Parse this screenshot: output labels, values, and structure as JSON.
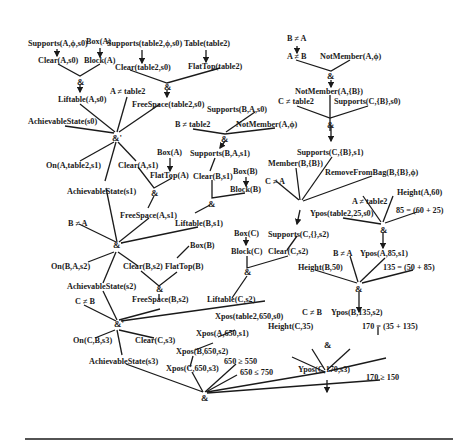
{
  "nodes": {
    "box_a": "Box(A)",
    "supports_a_phi_s0": "Supports(A,ϕ,s0)",
    "supports_table2_phi_s0": "Supports(table2,ϕ,s0)",
    "table_table2": "Table(table2)",
    "clear_a_s0": "Clear(A,s0)",
    "block_a": "Block(A)",
    "clear_table2_s0": "Clear(table2,s0)",
    "flattop_table2": "FlatTop(table2)",
    "liftable_a_s0": "Liftable(A,s0)",
    "a_neq_table2": "A ≠ table2",
    "freespace_table2_s0": "FreeSpace(table2,s0)",
    "achievable_s0": "AchievableState(s0)",
    "b_neq_a_top": "B ≠ A",
    "a_neq_b": "A ≠ B",
    "notmember_a_phi_top": "NotMember(A,ϕ)",
    "notmember_a_b": "NotMember(A,{B})",
    "c_neq_table2": "C ≠ table2",
    "supports_c_b_s0": "Supports(C,{B},s0)",
    "supports_b_a_s0": "Supports(B,A,s0)",
    "b_neq_table2": "B ≠ table2",
    "notmember_a_phi": "NotMember(A,ϕ)",
    "supports_c_b_s1": "Supports(C,{B},s1)",
    "member_b_b": "Member(B,{B})",
    "removefrombag": "RemoveFromBag(B,{B},ϕ)",
    "c_neq_a": "C ≠ A",
    "on_a_table2_s1": "On(A,table2,s1)",
    "clear_a_s1": "Clear(A,s1)",
    "box_a2": "Box(A)",
    "flattop_a": "FlatTop(A)",
    "achievable_s1": "AchievableState(s1)",
    "supports_b_a_s1": "Supports(B,A,s1)",
    "clear_b_s1": "Clear(B,s1)",
    "box_b": "Box(B)",
    "block_b": "Block(B)",
    "freespace_a_s1": "FreeSpace(A,s1)",
    "liftable_b_s1": "Liftable(B,s1)",
    "b_neq_a": "B ≠ A",
    "height_a_60": "Height(A,60)",
    "a_neq_table2_r": "A ≠ table2",
    "eq_85": "85 = (60 + 25)",
    "ypos_table2": "Ypos(table2,25,s0)",
    "box_c": "Box(C)",
    "supports_c_empty_s2": "Supports(C,{},s2)",
    "block_c": "Block(C)",
    "clear_c_s2": "Clear(C,s2)",
    "on_b_a_s2": "On(B,A,s2)",
    "box_b2": "Box(B)",
    "clear_b_s2": "Clear(B,s2)",
    "flattop_b": "FlatTop(B)",
    "b_neq_a_r": "B ≠ A",
    "ypos_a_85_s1": "Ypos(A,85,s1)",
    "height_b_50": "Height(B,50)",
    "eq_135": "135 = (50 + 85)",
    "achievable_s2": "AchievableState(s2)",
    "freespace_b_s2": "FreeSpace(B,s2)",
    "liftable_c_s2": "Liftable(C,s2)",
    "c_neq_b": "C ≠ B",
    "xpos_table2": "Xpos(table2,650,s0)",
    "c_neq_b_r": "C ≠ B",
    "ypos_b_135_s2": "Ypos(B,135,s2)",
    "height_c_35": "Height(C,35)",
    "eq_170": "170 = (35 + 135)",
    "xpos_a_650_s1": "Xpos(A,650,s1)",
    "on_c_b_s3": "On(C,B,s3)",
    "clear_c_s3": "Clear(C,s3)",
    "xpos_b_650_s2": "Xpos(B,650,s2)",
    "achievable_s3": "AchievableState(s3)",
    "xpos_c_650_s3": "Xpos(C,650,s3)",
    "ge_550": "650 ≥ 550",
    "le_750": "650 ≤ 750",
    "ypos_c_170_s3": "Ypos(C,170,s3)",
    "ge_150": "170 ≥ 150"
  },
  "junctions": {
    "and": "&",
    "and_prime": "&'"
  }
}
